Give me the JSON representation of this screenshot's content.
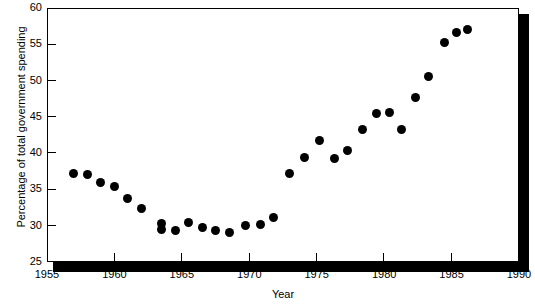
{
  "chart_data": {
    "type": "scatter",
    "title": "",
    "xlabel": "Year",
    "ylabel": "Percentage of total government spending",
    "xlim": [
      1955,
      1990
    ],
    "ylim": [
      25,
      60
    ],
    "xticks": [
      1955,
      1960,
      1965,
      1970,
      1975,
      1980,
      1985,
      1990
    ],
    "ytks": [
      25,
      30,
      35,
      40,
      45,
      50,
      55,
      60
    ],
    "yticks": [
      25,
      30,
      35,
      40,
      45,
      50,
      55,
      60
    ],
    "grid": false,
    "legend": null,
    "marker": "filled-circle",
    "marker_color": "#000000",
    "points": [
      {
        "x": 1957.0,
        "y": 37.2
      },
      {
        "x": 1958.0,
        "y": 37.0
      },
      {
        "x": 1959.0,
        "y": 36.0
      },
      {
        "x": 1960.0,
        "y": 35.4
      },
      {
        "x": 1961.0,
        "y": 33.7
      },
      {
        "x": 1962.0,
        "y": 32.4
      },
      {
        "x": 1963.5,
        "y": 30.3
      },
      {
        "x": 1963.5,
        "y": 29.5
      },
      {
        "x": 1964.5,
        "y": 29.4
      },
      {
        "x": 1965.5,
        "y": 30.5
      },
      {
        "x": 1966.5,
        "y": 29.7
      },
      {
        "x": 1967.5,
        "y": 29.3
      },
      {
        "x": 1968.5,
        "y": 29.1
      },
      {
        "x": 1969.7,
        "y": 30.0
      },
      {
        "x": 1970.8,
        "y": 30.1
      },
      {
        "x": 1971.8,
        "y": 31.2
      },
      {
        "x": 1973.0,
        "y": 37.2
      },
      {
        "x": 1974.1,
        "y": 39.4
      },
      {
        "x": 1975.2,
        "y": 41.7
      },
      {
        "x": 1976.3,
        "y": 39.2
      },
      {
        "x": 1977.3,
        "y": 40.4
      },
      {
        "x": 1978.4,
        "y": 43.3
      },
      {
        "x": 1979.4,
        "y": 45.4
      },
      {
        "x": 1980.4,
        "y": 45.6
      },
      {
        "x": 1981.3,
        "y": 43.2
      },
      {
        "x": 1982.3,
        "y": 47.6
      },
      {
        "x": 1983.3,
        "y": 50.5
      },
      {
        "x": 1984.5,
        "y": 55.2
      },
      {
        "x": 1985.4,
        "y": 56.6
      },
      {
        "x": 1986.2,
        "y": 57.0
      }
    ]
  },
  "axes": {
    "x_tick_labels": [
      "1955",
      "1960",
      "1965",
      "1970",
      "1975",
      "1980",
      "1985",
      "1990"
    ],
    "y_tick_labels": [
      "25",
      "30",
      "35",
      "40",
      "45",
      "50",
      "55",
      "60"
    ],
    "x_axis_title": "Year",
    "y_axis_title": "Percentage of total government spending"
  },
  "style": {
    "marker_color": "#000000",
    "frame_color": "#000000",
    "shadow_color": "#000000",
    "background": "#ffffff"
  }
}
